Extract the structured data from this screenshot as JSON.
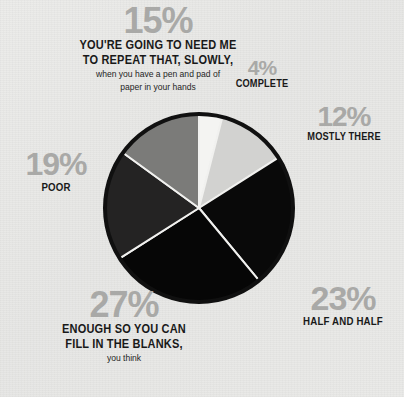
{
  "background_color": "#e9e9e7",
  "chart_data": {
    "type": "pie",
    "title": "",
    "center": {
      "x": 199,
      "y": 208
    },
    "radius": 94,
    "start_angle_deg": -90,
    "direction": "clockwise",
    "outline_color": "#101010",
    "separator_color": "#f1f1ef",
    "categories": [
      "COMPLETE",
      "MOSTLY THERE",
      "HALF AND HALF",
      "ENOUGH SO YOU CAN FILL IN THE BLANKS, you think",
      "POOR",
      "YOU'RE GOING TO NEED ME TO REPEAT THAT, SLOWLY, when you have a pen and pad of paper in your hands"
    ],
    "values": [
      4,
      12,
      23,
      27,
      19,
      15
    ],
    "colors": [
      "#f4f4f2",
      "#d2d2d0",
      "#090909",
      "#060606",
      "#242323",
      "#7b7b79"
    ],
    "legend_position": "callouts-around-pie",
    "grid": false
  },
  "callouts": [
    {
      "id": "need-me",
      "percent": "15%",
      "caption_lines": [
        "YOU'RE GOING TO NEED ME",
        "TO REPEAT THAT, SLOWLY,"
      ],
      "sub_lines": [
        "when you have a pen and pad of",
        "paper in your hands"
      ]
    },
    {
      "id": "complete",
      "percent": "4%",
      "caption_lines": [
        "COMPLETE"
      ],
      "sub_lines": []
    },
    {
      "id": "mostly-there",
      "percent": "12%",
      "caption_lines": [
        "MOSTLY THERE"
      ],
      "sub_lines": []
    },
    {
      "id": "poor",
      "percent": "19%",
      "caption_lines": [
        "POOR"
      ],
      "sub_lines": []
    },
    {
      "id": "half-and-half",
      "percent": "23%",
      "caption_lines": [
        "HALF AND HALF"
      ],
      "sub_lines": []
    },
    {
      "id": "enough",
      "percent": "27%",
      "caption_lines": [
        "ENOUGH SO YOU CAN",
        "FILL IN THE BLANKS,"
      ],
      "sub_lines": [
        "you think"
      ]
    }
  ]
}
